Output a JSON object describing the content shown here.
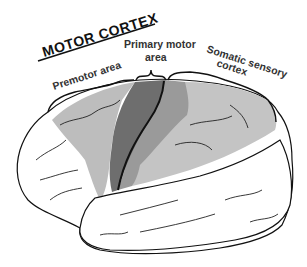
{
  "diagram": {
    "title": "MOTOR CORTEX",
    "labels": {
      "premotor": "Premotor area",
      "primary_line1": "Primary motor",
      "primary_line2": "area",
      "somatic_line1": "Somatic sensory",
      "somatic_line2": "cortex"
    },
    "colors": {
      "premotor": "#bdbdbd",
      "primary_motor": "#6e6e6e",
      "postcentral": "#9a9a9a",
      "somatic_sensory": "#c4c4c4",
      "outline": "#111111",
      "background": "#ffffff"
    }
  }
}
